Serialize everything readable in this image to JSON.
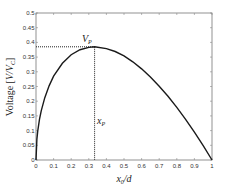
{
  "chart_data": {
    "type": "line",
    "title": "",
    "xlabel": "x_0/d",
    "ylabel": "Voltage [V/V_C]",
    "xlim": [
      0,
      1
    ],
    "ylim": [
      0,
      0.5
    ],
    "grid": false,
    "legend": null,
    "x_ticks": [
      "0",
      "0.1",
      "0.2",
      "0.3",
      "0.4",
      "0.5",
      "0.6",
      "0.7",
      "0.8",
      "0.9",
      "1"
    ],
    "y_ticks": [
      "0",
      "0.05",
      "0.1",
      "0.15",
      "0.2",
      "0.25",
      "0.3",
      "0.35",
      "0.4",
      "0.45",
      "0.5"
    ],
    "series": [
      {
        "name": "Voltage",
        "x": [
          0,
          0.005,
          0.01,
          0.02,
          0.03,
          0.05,
          0.075,
          0.1,
          0.15,
          0.2,
          0.25,
          0.3,
          0.333,
          0.4,
          0.45,
          0.5,
          0.55,
          0.6,
          0.65,
          0.7,
          0.75,
          0.8,
          0.85,
          0.9,
          0.95,
          1.0
        ],
        "values": [
          0,
          0.07,
          0.099,
          0.139,
          0.168,
          0.212,
          0.253,
          0.285,
          0.329,
          0.358,
          0.375,
          0.383,
          0.385,
          0.379,
          0.369,
          0.354,
          0.334,
          0.31,
          0.282,
          0.251,
          0.217,
          0.179,
          0.138,
          0.095,
          0.049,
          0
        ]
      }
    ],
    "annotations": [
      {
        "text": "V_P",
        "x": 0.3,
        "y": 0.41,
        "type": "label"
      },
      {
        "text": "x_P",
        "x": 0.345,
        "y": 0.13,
        "type": "label"
      },
      {
        "type": "hline-dotted",
        "y": 0.385,
        "x_from": 0,
        "x_to": 0.333
      },
      {
        "type": "vline-dotted",
        "x": 0.333,
        "y_from": 0,
        "y_to": 0.385
      }
    ],
    "peak": {
      "x": 0.333,
      "y": 0.385
    }
  },
  "labels": {
    "xlabel_main": "x",
    "xlabel_sub": "0",
    "xlabel_rest": "/d",
    "ylabel_main": "Voltage [",
    "ylabel_v": "V/V",
    "ylabel_sub": "C",
    "ylabel_end": "]",
    "vp_main": "V",
    "vp_sub": "P",
    "xp_main": "x",
    "xp_sub": "P"
  }
}
